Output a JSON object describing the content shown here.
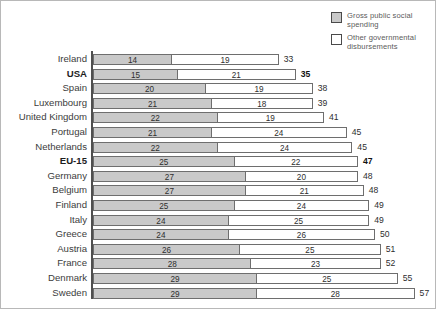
{
  "legend": {
    "items": [
      {
        "key": "gross",
        "label": "Gross public social spending",
        "swatch_color": "#c9c9c9"
      },
      {
        "key": "other",
        "label": "Other governmental disbursements",
        "swatch_color": "#ffffff"
      }
    ]
  },
  "chart_data": {
    "type": "bar",
    "orientation": "horizontal",
    "stacked": true,
    "title": "",
    "xlabel": "",
    "ylabel": "",
    "grid": false,
    "legend_position": "top-right",
    "xlim": [
      0,
      60
    ],
    "categories": [
      "Ireland",
      "USA",
      "Spain",
      "Luxembourg",
      "United Kingdom",
      "Portugal",
      "Netherlands",
      "EU-15",
      "Germany",
      "Belgium",
      "Finland",
      "Italy",
      "Greece",
      "Austria",
      "France",
      "Denmark",
      "Sweden"
    ],
    "emphasized_categories": [
      "USA",
      "EU-15"
    ],
    "series": [
      {
        "name": "Gross public social spending",
        "color": "#c9c9c9",
        "values": [
          14,
          15,
          20,
          21,
          22,
          21,
          22,
          25,
          27,
          27,
          25,
          24,
          24,
          26,
          28,
          29,
          29
        ]
      },
      {
        "name": "Other governmental disbursements",
        "color": "#ffffff",
        "values": [
          19,
          21,
          19,
          18,
          19,
          24,
          24,
          22,
          20,
          21,
          24,
          25,
          26,
          25,
          23,
          25,
          28
        ]
      }
    ],
    "totals": [
      33,
      35,
      38,
      39,
      41,
      45,
      45,
      47,
      48,
      48,
      49,
      49,
      50,
      51,
      52,
      55,
      57
    ]
  }
}
